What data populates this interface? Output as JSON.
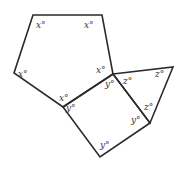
{
  "diagram": {
    "type": "geometry",
    "colors": {
      "stroke": "#2a2a2a",
      "label": "#333333",
      "background": "#ffffff"
    },
    "shapes": {
      "pentagon": {
        "points": "33,15 102,15 113,74 63,107 14,73",
        "angle_label": "x°",
        "labels": [
          {
            "text": "x°",
            "x": 36,
            "y": 28
          },
          {
            "text": "x°",
            "x": 84,
            "y": 28
          },
          {
            "text": "x°",
            "x": 18,
            "y": 77
          },
          {
            "text": "x°",
            "x": 96,
            "y": 73
          },
          {
            "text": "x°",
            "x": 59,
            "y": 101
          }
        ]
      },
      "square": {
        "points": "113,74 150,123 100,157 63,107",
        "angle_label": "y°",
        "labels": [
          {
            "text": "y°",
            "x": 105,
            "y": 87
          },
          {
            "text": "y°",
            "x": 66,
            "y": 111
          },
          {
            "text": "y°",
            "x": 131,
            "y": 123
          },
          {
            "text": "y°",
            "x": 100,
            "y": 148
          }
        ]
      },
      "triangle": {
        "points": "113,74 173,67 150,123",
        "angle_label": "z°",
        "labels": [
          {
            "text": "z°",
            "x": 123,
            "y": 84
          },
          {
            "text": "z°",
            "x": 155,
            "y": 77
          },
          {
            "text": "z°",
            "x": 144,
            "y": 110
          }
        ]
      }
    }
  }
}
